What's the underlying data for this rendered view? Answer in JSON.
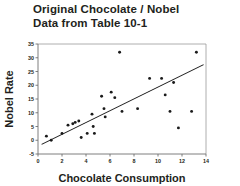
{
  "chart_data": {
    "type": "scatter",
    "title": "Original Chocolate / Nobel Data from Table 10-1",
    "title_lines": [
      "Original Chocolate / Nobel",
      "Data from Table 10-1"
    ],
    "xlabel": "Chocolate Consumption",
    "ylabel": "Nobel Rate",
    "xlim": [
      0,
      14
    ],
    "ylim": [
      -5,
      35
    ],
    "xticks": [
      0,
      2,
      4,
      6,
      8,
      10,
      12,
      14
    ],
    "yticks": [
      -5,
      0,
      5,
      10,
      15,
      20,
      25,
      30,
      35
    ],
    "xtick_labels": [
      "0",
      "2",
      "4",
      "6",
      "8",
      "10",
      "12",
      "14"
    ],
    "ytick_labels": [
      "-5",
      "0",
      "5",
      "10",
      "15",
      "20",
      "25",
      "30",
      "35"
    ],
    "grid": false,
    "legend": false,
    "marker_color": "#1a1a1a",
    "line_color": "#1a1a1a",
    "axis_color": "#6f6f6f",
    "frame_color": "#9a9a9a",
    "background": "#ffffff",
    "points": [
      {
        "x": 0.7,
        "y": 1.5
      },
      {
        "x": 1.1,
        "y": 0.0
      },
      {
        "x": 2.0,
        "y": 2.5
      },
      {
        "x": 2.5,
        "y": 5.5
      },
      {
        "x": 2.9,
        "y": 6.0
      },
      {
        "x": 3.1,
        "y": 6.5
      },
      {
        "x": 3.4,
        "y": 7.0
      },
      {
        "x": 3.6,
        "y": 1.0
      },
      {
        "x": 4.1,
        "y": 2.5
      },
      {
        "x": 4.5,
        "y": 9.5
      },
      {
        "x": 4.6,
        "y": 5.0
      },
      {
        "x": 4.7,
        "y": 2.5
      },
      {
        "x": 5.3,
        "y": 16.0
      },
      {
        "x": 5.5,
        "y": 11.5
      },
      {
        "x": 5.6,
        "y": 8.5
      },
      {
        "x": 6.1,
        "y": 17.5
      },
      {
        "x": 6.4,
        "y": 15.5
      },
      {
        "x": 6.8,
        "y": 32.0
      },
      {
        "x": 7.0,
        "y": 10.5
      },
      {
        "x": 8.3,
        "y": 11.5
      },
      {
        "x": 9.3,
        "y": 22.5
      },
      {
        "x": 10.3,
        "y": 22.5
      },
      {
        "x": 10.6,
        "y": 16.5
      },
      {
        "x": 11.0,
        "y": 10.5
      },
      {
        "x": 11.3,
        "y": 21.0
      },
      {
        "x": 11.7,
        "y": 4.5
      },
      {
        "x": 12.8,
        "y": 10.5
      },
      {
        "x": 13.2,
        "y": 32.0
      }
    ],
    "fit_line": {
      "x_start": 0.3,
      "y_start": -1.5,
      "x_end": 13.8,
      "y_end": 27.5
    }
  }
}
